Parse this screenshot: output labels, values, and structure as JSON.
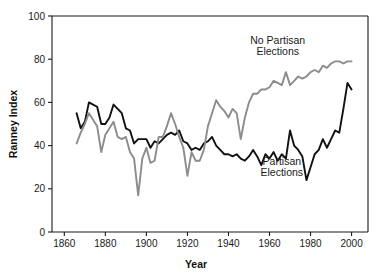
{
  "chart_data": {
    "type": "line",
    "title": "",
    "xlabel": "Year",
    "ylabel": "Ranney Index",
    "xlim": [
      1854,
      2008
    ],
    "ylim": [
      0,
      100
    ],
    "xticks": [
      1860,
      1880,
      1900,
      1920,
      1940,
      1960,
      1980,
      2000
    ],
    "xtick_labels": [
      "1860",
      "1880",
      "1900",
      "1920",
      "1940",
      "1960",
      "1980",
      "2000"
    ],
    "yticks": [
      0,
      20,
      40,
      60,
      80,
      100
    ],
    "ytick_labels": [
      "0",
      "20",
      "40",
      "60",
      "80",
      "100"
    ],
    "grid": false,
    "legend_position": "inline-annotations",
    "annotations": [
      {
        "text_line1": "No Partisan",
        "text_line2": "Elections",
        "x": 1964,
        "y": 87
      },
      {
        "text_line1": "Partisan",
        "text_line2": "Elections",
        "x": 1966,
        "y": 31
      }
    ],
    "series": [
      {
        "name": "Partisan Elections",
        "color": "#111111",
        "width": 1.9,
        "x": [
          1866,
          1868,
          1870,
          1872,
          1874,
          1876,
          1878,
          1880,
          1882,
          1884,
          1886,
          1888,
          1890,
          1892,
          1894,
          1896,
          1898,
          1900,
          1902,
          1904,
          1906,
          1908,
          1910,
          1912,
          1914,
          1916,
          1918,
          1920,
          1922,
          1924,
          1926,
          1928,
          1930,
          1932,
          1934,
          1936,
          1938,
          1940,
          1942,
          1944,
          1946,
          1948,
          1950,
          1952,
          1954,
          1956,
          1958,
          1960,
          1962,
          1964,
          1966,
          1968,
          1970,
          1972,
          1974,
          1976,
          1978,
          1980,
          1982,
          1984,
          1986,
          1988,
          1990,
          1992,
          1994,
          1996,
          1998,
          2000
        ],
        "values": [
          55,
          48,
          51,
          60,
          59,
          58,
          50,
          50,
          53,
          59,
          57,
          55,
          48,
          47,
          41,
          43,
          43,
          43,
          39,
          42,
          41,
          43,
          45,
          46,
          45,
          47,
          42,
          41,
          38,
          39,
          38,
          41,
          42,
          44,
          40,
          38,
          36,
          36,
          35,
          36,
          34,
          33,
          35,
          38,
          35,
          31,
          36,
          34,
          37,
          33,
          36,
          34,
          47,
          40,
          38,
          35,
          24,
          30,
          36,
          38,
          43,
          39,
          43,
          47,
          46,
          57,
          69,
          66
        ]
      },
      {
        "name": "No Partisan Elections",
        "color": "#8c8c8c",
        "width": 1.9,
        "x": [
          1866,
          1868,
          1870,
          1872,
          1874,
          1876,
          1878,
          1880,
          1882,
          1884,
          1886,
          1888,
          1890,
          1892,
          1894,
          1896,
          1898,
          1900,
          1902,
          1904,
          1906,
          1908,
          1910,
          1912,
          1914,
          1916,
          1918,
          1920,
          1922,
          1924,
          1926,
          1928,
          1930,
          1932,
          1934,
          1936,
          1938,
          1940,
          1942,
          1944,
          1946,
          1948,
          1950,
          1952,
          1954,
          1956,
          1958,
          1960,
          1962,
          1964,
          1966,
          1968,
          1970,
          1972,
          1974,
          1976,
          1978,
          1980,
          1982,
          1984,
          1986,
          1988,
          1990,
          1992,
          1994,
          1996,
          1998,
          2000
        ],
        "values": [
          41,
          46,
          50,
          55,
          52,
          49,
          37,
          45,
          48,
          51,
          44,
          43,
          44,
          37,
          34,
          17,
          34,
          39,
          32,
          33,
          44,
          44,
          49,
          55,
          50,
          44,
          39,
          26,
          37,
          33,
          33,
          38,
          49,
          55,
          61,
          58,
          56,
          53,
          57,
          55,
          43,
          53,
          60,
          64,
          64,
          66,
          66,
          67,
          70,
          69,
          68,
          74,
          68,
          70,
          72,
          71,
          72,
          74,
          75,
          74,
          77,
          76,
          78,
          79,
          79,
          78,
          79,
          79
        ]
      }
    ]
  },
  "axes": {
    "x_title": "Year",
    "y_title": "Ranney Index"
  }
}
